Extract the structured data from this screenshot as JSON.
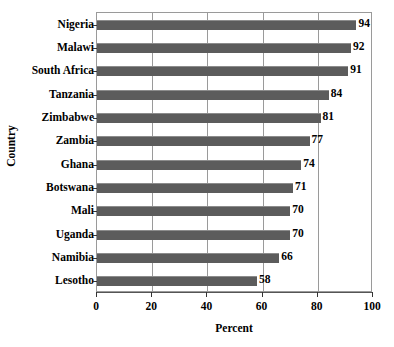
{
  "chart_data": {
    "type": "bar",
    "orientation": "horizontal",
    "title": "",
    "xlabel": "Percent",
    "ylabel": "Country",
    "xlim": [
      0,
      100
    ],
    "xticks": [
      0,
      20,
      40,
      60,
      80,
      100
    ],
    "grid": true,
    "legend": false,
    "bar_color": "#5c5c5c",
    "categories": [
      "Nigeria",
      "Malawi",
      "South Africa",
      "Tanzania",
      "Zimbabwe",
      "Zambia",
      "Ghana",
      "Botswana",
      "Mali",
      "Uganda",
      "Namibia",
      "Lesotho"
    ],
    "values": [
      94,
      92,
      91,
      84,
      81,
      77,
      74,
      71,
      70,
      70,
      66,
      58
    ],
    "value_labels": [
      "94",
      "92",
      "91",
      "84",
      "81",
      "77",
      "74",
      "71",
      "70",
      "70",
      "66",
      "58"
    ],
    "xtick_labels": [
      "0",
      "20",
      "40",
      "60",
      "80",
      "100"
    ]
  }
}
